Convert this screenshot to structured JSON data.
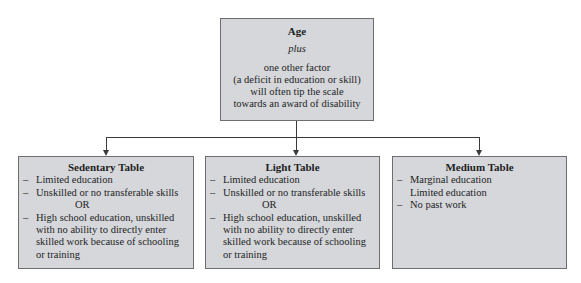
{
  "top_box": {
    "title": "Age",
    "plus": "plus",
    "lines": [
      "one other factor",
      "(a deficit in education or skill)",
      "will often tip the scale",
      "towards an award of disability"
    ]
  },
  "tables": [
    {
      "title": "Sedentary Table",
      "item1": "Limited education",
      "item2": "Unskilled or no transferable skills",
      "or": "OR",
      "item3_lines": [
        "High school education, unskilled",
        "with no ability to directly enter",
        "skilled work because of schooling",
        "or training"
      ]
    },
    {
      "title": "Light Table",
      "item1": "Limited education",
      "item2": "Unskilled or no transferable skills",
      "or": "OR",
      "item3_lines": [
        "High school education, unskilled",
        "with no ability to directly enter",
        "skilled work because of schooling",
        "or training"
      ]
    },
    {
      "title": "Medium Table",
      "item1": "Marginal education",
      "item1_cont": "Limited education",
      "item2": "No past work"
    }
  ],
  "dash": "–",
  "colors": {
    "box_fill": "#d5d7db",
    "box_border": "#6e6e6e",
    "connector": "#3a3a3a"
  }
}
